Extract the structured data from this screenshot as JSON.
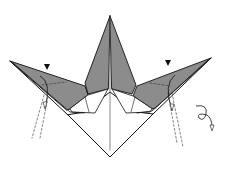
{
  "diagram": {
    "type": "origami-step",
    "colors": {
      "background": "#ffffff",
      "paper_colored_side": "#8c8c8c",
      "paper_white_side": "#ffffff",
      "line": "#111111"
    },
    "symbols": [
      {
        "name": "push-arrow-left",
        "meaning": "sink/push point"
      },
      {
        "name": "push-arrow-right",
        "meaning": "sink/push point"
      },
      {
        "name": "fold-arrow-left",
        "meaning": "fold flap down"
      },
      {
        "name": "fold-arrow-right",
        "meaning": "fold flap down"
      },
      {
        "name": "turn-over-symbol",
        "meaning": "turn model over"
      }
    ]
  }
}
